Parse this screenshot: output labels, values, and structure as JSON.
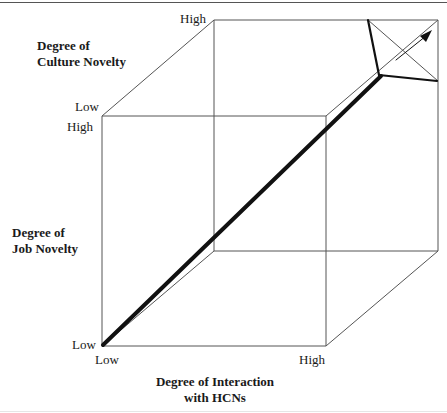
{
  "diagram": {
    "type": "3d-cube-framework",
    "axes": {
      "culture_novelty": {
        "title_line1": "Degree of",
        "title_line2": "Culture Novelty",
        "low": "Low",
        "high": "High"
      },
      "job_novelty": {
        "title_line1": "Degree of",
        "title_line2": "Job Novelty",
        "low": "Low",
        "high": "High"
      },
      "interaction": {
        "title_line1": "Degree of Interaction",
        "title_line2": "with HCNs",
        "low": "Low",
        "high": "High"
      }
    },
    "arrow": {
      "from": "Low-Low-Low corner",
      "to": "High-High-High corner",
      "description": "Thick diagonal arrow from front-bottom-left to back-top-right"
    },
    "colors": {
      "line": "#555555",
      "arrow": "#111111",
      "text": "#1a1a1a",
      "background": "#ffffff"
    }
  }
}
